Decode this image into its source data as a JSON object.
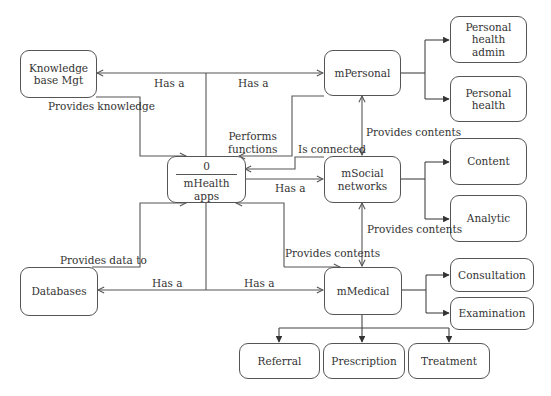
{
  "diagram": {
    "type": "data-flow-diagram",
    "central_process": {
      "id": "0",
      "label": "mHealth\napps"
    },
    "nodes": {
      "knowledge": "Knowledge\nbase Mgt",
      "databases": "Databases",
      "mpersonal": "mPersonal",
      "msocial": "mSocial\nnetworks",
      "mmedical": "mMedical",
      "personal_health_admin": "Personal\nhealth\nadmin",
      "personal_health": "Personal\nhealth",
      "content": "Content",
      "analytic": "Analytic",
      "consultation": "Consultation",
      "examination": "Examination",
      "referral": "Referral",
      "prescription": "Prescription",
      "treatment": "Treatment"
    },
    "edge_labels": {
      "has_a_knowledge": "Has a",
      "has_a_mpersonal": "Has a",
      "provides_knowledge": "Provides knowledge",
      "performs_functions": "Performs\nfunctions",
      "is_connected": "Is connected",
      "has_a_msocial": "Has a",
      "provides_contents_personal_social": "Provides contents",
      "provides_contents_social_medical": "Provides contents",
      "provides_contents_medical": "Provides contents",
      "provides_data_to": "Provides data to",
      "has_a_databases": "Has a",
      "has_a_mmedical": "Has a"
    },
    "edges": [
      {
        "from": "mHealth apps",
        "to": "Knowledge base Mgt",
        "label": "Has a"
      },
      {
        "from": "mHealth apps",
        "to": "mPersonal",
        "label": "Has a"
      },
      {
        "from": "Knowledge base Mgt",
        "to": "mHealth apps",
        "label": "Provides knowledge"
      },
      {
        "from": "mPersonal",
        "to": "mHealth apps",
        "label": "Performs functions"
      },
      {
        "from": "mSocial networks",
        "to": "mHealth apps",
        "label": "Is connected"
      },
      {
        "from": "mHealth apps",
        "to": "mSocial networks",
        "label": "Has a"
      },
      {
        "from": "mPersonal",
        "to": "mSocial networks",
        "label": "Provides contents",
        "bidirectional": true
      },
      {
        "from": "mSocial networks",
        "to": "mMedical",
        "label": "Provides contents",
        "bidirectional": true
      },
      {
        "from": "mHealth apps",
        "to": "mMedical",
        "label": "Provides contents",
        "bidirectional": true
      },
      {
        "from": "Databases",
        "to": "mHealth apps",
        "label": "Provides data to"
      },
      {
        "from": "mHealth apps",
        "to": "Databases",
        "label": "Has a"
      },
      {
        "from": "mHealth apps",
        "to": "mMedical",
        "label": "Has a"
      },
      {
        "from": "mPersonal",
        "to": "Personal health admin"
      },
      {
        "from": "mPersonal",
        "to": "Personal health"
      },
      {
        "from": "mSocial networks",
        "to": "Content"
      },
      {
        "from": "mSocial networks",
        "to": "Analytic"
      },
      {
        "from": "mMedical",
        "to": "Consultation"
      },
      {
        "from": "mMedical",
        "to": "Examination"
      },
      {
        "from": "mMedical",
        "to": "Referral"
      },
      {
        "from": "mMedical",
        "to": "Prescription"
      },
      {
        "from": "mMedical",
        "to": "Treatment"
      }
    ]
  }
}
